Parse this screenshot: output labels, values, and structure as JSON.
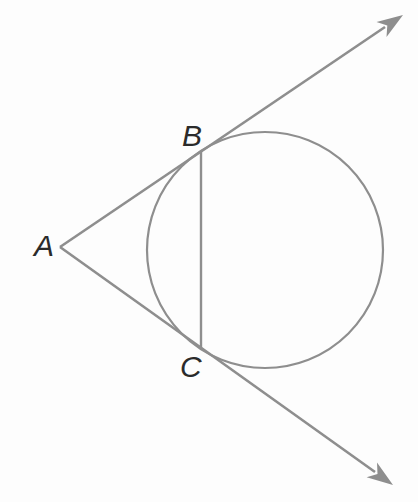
{
  "figure": {
    "vertex": {
      "x": 60,
      "y": 247
    },
    "circle": {
      "cx": 265,
      "cy": 250,
      "r": 118
    },
    "chord": {
      "x1": 201,
      "y1": 151,
      "x2": 201,
      "y2": 348
    },
    "upper_ray": {
      "x1": 60,
      "y1": 247,
      "x2": 385,
      "y2": 27,
      "arrow_points": "403,15 386.5,37.1 387.3,25.6 376.5,22.1"
    },
    "lower_ray": {
      "x1": 60,
      "y1": 247,
      "x2": 375,
      "y2": 472,
      "arrow_points": "393,485 366.6,477.2 377.5,474.0 377.0,462.6"
    },
    "labels": {
      "A": {
        "text": "A",
        "x": 34,
        "y": 256
      },
      "B": {
        "text": "B",
        "x": 182,
        "y": 146
      },
      "C": {
        "text": "C",
        "x": 180,
        "y": 377
      }
    }
  },
  "colors": {
    "line": "#8e8e8e",
    "label": "#2b2b2b",
    "background": "#fdfdfd"
  }
}
